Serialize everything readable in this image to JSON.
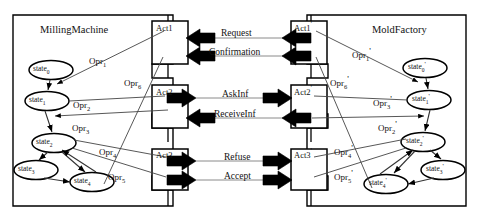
{
  "diagram": {
    "title_left": "MillingMachine",
    "title_right": "MoldFactory",
    "left_agent": {
      "activities": [
        {
          "name": "Act1"
        },
        {
          "name": "Act2"
        },
        {
          "name": "Act3"
        }
      ],
      "states": [
        {
          "label": "state",
          "sub": "0"
        },
        {
          "label": "state",
          "sub": "1"
        },
        {
          "label": "state",
          "sub": "2"
        },
        {
          "label": "state",
          "sub": "3"
        },
        {
          "label": "state",
          "sub": "4"
        }
      ],
      "operations": [
        {
          "label": "Opr",
          "sub": "1"
        },
        {
          "label": "Opr",
          "sub": "2"
        },
        {
          "label": "Opr",
          "sub": "3"
        },
        {
          "label": "Opr",
          "sub": "4"
        },
        {
          "label": "Opr",
          "sub": "5"
        },
        {
          "label": "Opr",
          "sub": "6"
        }
      ]
    },
    "right_agent": {
      "activities": [
        {
          "name": "Act1",
          "prime": "'"
        },
        {
          "name": "Act2",
          "prime": "'"
        },
        {
          "name": "Act3",
          "prime": "'"
        }
      ],
      "states": [
        {
          "label": "state",
          "sub": "0",
          "prime": "'"
        },
        {
          "label": "state",
          "sub": "1",
          "prime": "'"
        },
        {
          "label": "state",
          "sub": "2",
          "prime": "'"
        },
        {
          "label": "state",
          "sub": "3",
          "prime": "'"
        },
        {
          "label": "state",
          "sub": "4",
          "prime": "'"
        }
      ],
      "operations": [
        {
          "label": "Opr",
          "sub": "1",
          "prime": "'"
        },
        {
          "label": "Opr",
          "sub": "2",
          "prime": "'"
        },
        {
          "label": "Opr",
          "sub": "3",
          "prime": "'"
        },
        {
          "label": "Opr",
          "sub": "4",
          "prime": "'"
        },
        {
          "label": "Opr",
          "sub": "5",
          "prime": "'"
        },
        {
          "label": "Opr",
          "sub": "6",
          "prime": "'"
        }
      ]
    },
    "messages": [
      {
        "name": "Request",
        "direction": "left"
      },
      {
        "name": "Confirmation",
        "direction": "left"
      },
      {
        "name": "AskInf",
        "direction": "right"
      },
      {
        "name": "ReceiveInf",
        "direction": "left"
      },
      {
        "name": "Refuse",
        "direction": "right"
      },
      {
        "name": "Accept",
        "direction": "right"
      }
    ],
    "colors": {
      "stroke": "#000000",
      "thin_line": "#555555",
      "fill": "#ffffff",
      "arrow_fill": "#000000"
    }
  }
}
